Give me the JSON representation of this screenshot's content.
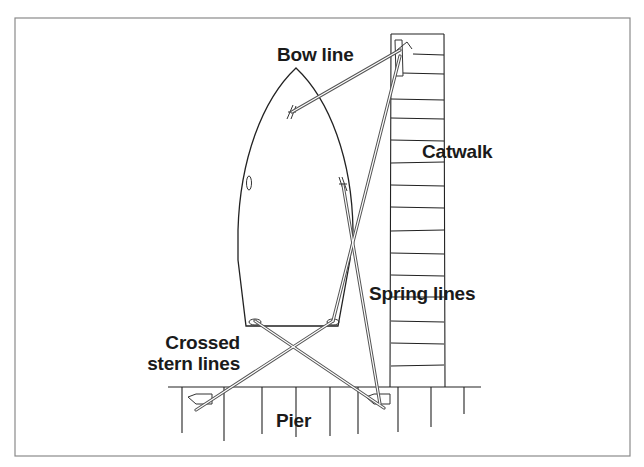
{
  "diagram": {
    "type": "mooring-diagram",
    "colors": {
      "ink": "#222222",
      "rope": "#555555",
      "frame": "#888888",
      "background": "#ffffff"
    },
    "labels": {
      "bow_line": "Bow line",
      "catwalk": "Catwalk",
      "spring_lines": "Spring lines",
      "crossed_stern_lines_1": "Crossed",
      "crossed_stern_lines_2": "stern lines",
      "pier": "Pier"
    },
    "components": [
      {
        "id": "boat",
        "description": "Boat hull viewed from above, bow pointing up"
      },
      {
        "id": "catwalk",
        "description": "Planked catwalk on right side of slip"
      },
      {
        "id": "pier",
        "description": "Planked pier along bottom"
      },
      {
        "id": "bow-line",
        "from": "bow cleat",
        "to": "catwalk cleat"
      },
      {
        "id": "spring-line-1",
        "from": "midship cleat",
        "to": "pier right cleat"
      },
      {
        "id": "spring-line-2",
        "from": "stern starboard cleat",
        "to": "catwalk cleat"
      },
      {
        "id": "stern-line-1",
        "from": "stern port cleat",
        "to": "pier right cleat"
      },
      {
        "id": "stern-line-2",
        "from": "stern starboard cleat",
        "to": "pier left cleat"
      }
    ]
  }
}
